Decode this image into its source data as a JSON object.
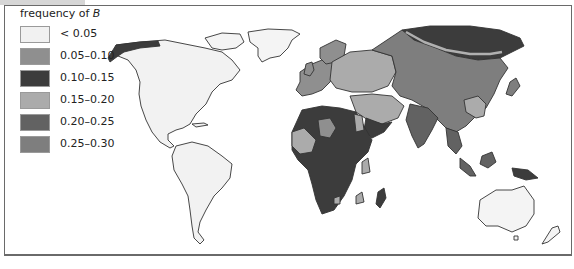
{
  "legend": {
    "title_prefix": "frequency of ",
    "title_variable": "B",
    "items": [
      {
        "label": "< 0.05",
        "color": "#f1f1f1"
      },
      {
        "label": "0.05–0.10",
        "color": "#8f8f8f"
      },
      {
        "label": "0.10–0.15",
        "color": "#3c3c3c"
      },
      {
        "label": "0.15–0.20",
        "color": "#ababab"
      },
      {
        "label": "0.20–0.25",
        "color": "#626262"
      },
      {
        "label": "0.25–0.30",
        "color": "#7e7e7e"
      }
    ]
  },
  "map": {
    "subject": "World distribution of blood group allele B frequency",
    "regions": [
      {
        "name": "North America",
        "class": "< 0.05"
      },
      {
        "name": "South America",
        "class": "< 0.05"
      },
      {
        "name": "Greenland",
        "class": "< 0.05"
      },
      {
        "name": "Australia",
        "class": "< 0.05"
      },
      {
        "name": "Alaska coast",
        "class": "0.10–0.15"
      },
      {
        "name": "Western Europe",
        "class": "0.05–0.10"
      },
      {
        "name": "Eastern Europe",
        "class": "0.15–0.20"
      },
      {
        "name": "Northern Siberia",
        "class": "0.10–0.15"
      },
      {
        "name": "Central Asia",
        "class": "0.25–0.30"
      },
      {
        "name": "Sub-Saharan Africa",
        "class": "0.10–0.15"
      },
      {
        "name": "Middle East",
        "class": "0.15–0.20"
      },
      {
        "name": "India",
        "class": "0.20–0.25"
      },
      {
        "name": "Southeast Asia",
        "class": "0.20–0.25"
      },
      {
        "name": "New Guinea",
        "class": "0.10–0.15"
      }
    ]
  }
}
